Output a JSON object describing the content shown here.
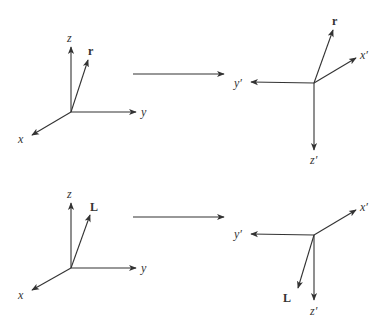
{
  "diagram": {
    "stroke_color": "#333333",
    "panels": [
      {
        "id": "top-left",
        "origin": [
          71,
          112
        ],
        "axes": [
          {
            "name": "z",
            "label": "z",
            "tip": [
              71,
              47
            ],
            "label_pos": [
              67,
              42
            ]
          },
          {
            "name": "y",
            "label": "y",
            "tip": [
              136,
              112
            ],
            "label_pos": [
              141,
              116
            ]
          },
          {
            "name": "x",
            "label": "x",
            "tip": [
              32,
              135
            ],
            "label_pos": [
              18,
              143
            ]
          },
          {
            "name": "r",
            "label": "r",
            "tip": [
              88,
              60
            ],
            "label_pos": [
              88,
              55
            ],
            "bold": true
          }
        ]
      },
      {
        "id": "top-right",
        "origin": [
          314,
          83
        ],
        "axes": [
          {
            "name": "r",
            "label": "r",
            "tip": [
              333,
              30
            ],
            "label_pos": [
              332,
              25
            ],
            "bold": true
          },
          {
            "name": "x-prime",
            "label": "x′",
            "tip": [
              356,
              58
            ],
            "label_pos": [
              360,
              59
            ]
          },
          {
            "name": "y-prime",
            "label": "y′",
            "tip": [
              251,
              82
            ],
            "label_pos": [
              234,
              87
            ]
          },
          {
            "name": "z-prime",
            "label": "z′",
            "tip": [
              314,
              150
            ],
            "label_pos": [
              310,
              164
            ]
          }
        ]
      },
      {
        "id": "bottom-left",
        "origin": [
          71,
          268
        ],
        "axes": [
          {
            "name": "z",
            "label": "z",
            "tip": [
              71,
              203
            ],
            "label_pos": [
              67,
              198
            ]
          },
          {
            "name": "y",
            "label": "y",
            "tip": [
              136,
              268
            ],
            "label_pos": [
              141,
              272
            ]
          },
          {
            "name": "x",
            "label": "x",
            "tip": [
              32,
              290
            ],
            "label_pos": [
              18,
              299
            ]
          },
          {
            "name": "L",
            "label": "L",
            "tip": [
              90,
              215
            ],
            "label_pos": [
              90,
              211
            ],
            "bold": true
          }
        ]
      },
      {
        "id": "bottom-right",
        "origin": [
          314,
          235
        ],
        "axes": [
          {
            "name": "x-prime",
            "label": "x′",
            "tip": [
              356,
              210
            ],
            "label_pos": [
              360,
              211
            ]
          },
          {
            "name": "y-prime",
            "label": "y′",
            "tip": [
              251,
              234
            ],
            "label_pos": [
              234,
              238
            ]
          },
          {
            "name": "L",
            "label": "L",
            "tip": [
              298,
              288
            ],
            "label_pos": [
              283,
              302
            ],
            "bold": true
          },
          {
            "name": "z-prime",
            "label": "z′",
            "tip": [
              314,
              300
            ],
            "label_pos": [
              310,
              315
            ]
          }
        ]
      }
    ],
    "transition_arrows": [
      {
        "id": "top",
        "from": [
          133,
          74
        ],
        "to": [
          224,
          74
        ]
      },
      {
        "id": "bottom",
        "from": [
          133,
          217
        ],
        "to": [
          224,
          217
        ]
      }
    ]
  }
}
